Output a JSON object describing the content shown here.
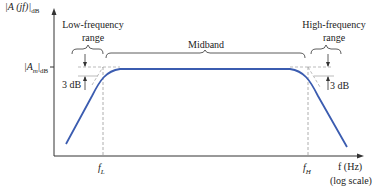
{
  "diagram": {
    "y_axis_label": "|A (jf)|",
    "y_axis_sub": "dB",
    "x_axis_label": "f (Hz)",
    "x_axis_note": "(log scale)",
    "midband_gain_label": "|A",
    "midband_gain_sub1": "m",
    "midband_gain_sub2": "dB",
    "regions": {
      "low": {
        "line1": "Low-frequency",
        "line2": "range"
      },
      "mid": {
        "label": "Midband"
      },
      "high": {
        "line1": "High-frequency",
        "line2": "range"
      }
    },
    "drop_low": "3 dB",
    "drop_high": "3 dB",
    "f_low": {
      "main": "f",
      "sub": "L"
    },
    "f_high": {
      "main": "f",
      "sub": "H"
    },
    "colors": {
      "curve": "#3b5cb0",
      "axis": "#333333",
      "dashed": "#999999"
    }
  }
}
